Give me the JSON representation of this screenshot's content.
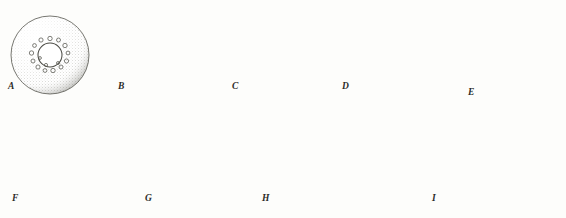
{
  "figure": {
    "kind": "scientific-illustration",
    "technique": "stipple engraving",
    "page_number": "",
    "background_color": "#fdfdfb",
    "ink_color": "#3a3a36",
    "rows": 2,
    "panel_count": 9
  },
  "panels": [
    {
      "id": "A",
      "label": "A",
      "row": 1,
      "description": "spherical egg with pale central blastodisc ringed by scattered cells",
      "center": {
        "x": 50,
        "y": 55
      },
      "radius": 39,
      "label_pos": {
        "x": 8,
        "y": 88
      },
      "inner": {
        "type": "open-ring",
        "cx": 50,
        "cy": 55,
        "r": 12,
        "cells": 14,
        "cell_r": 2.1,
        "fill": "#ffffff"
      }
    },
    {
      "id": "B",
      "label": "B",
      "row": 1,
      "description": "egg with dense dark central cell mass surrounded by a broad ring of cells",
      "center": {
        "x": 160,
        "y": 55
      },
      "radius": 39,
      "label_pos": {
        "x": 118,
        "y": 88
      },
      "inner": {
        "type": "dark-mass",
        "cx": 160,
        "cy": 55,
        "r": 13,
        "cells": 22,
        "cell_r": 2.1,
        "fill": "#4a4a45"
      }
    },
    {
      "id": "C",
      "label": "C",
      "row": 1,
      "description": "egg with pale blastodisc outlined by a germ ring, small notch at right",
      "center": {
        "x": 272,
        "y": 55
      },
      "radius": 38,
      "label_pos": {
        "x": 232,
        "y": 88
      },
      "inner": {
        "type": "outlined-disc",
        "cx": 270,
        "cy": 56,
        "r": 13,
        "cells": 20,
        "cell_r": 1.9,
        "fill": "#fbfbf8"
      }
    },
    {
      "id": "D",
      "label": "D",
      "row": 1,
      "description": "egg with enlarged blastodisc and thickened germ ring, notch at right",
      "center": {
        "x": 382,
        "y": 55
      },
      "radius": 38,
      "label_pos": {
        "x": 342,
        "y": 88
      },
      "inner": {
        "type": "outlined-disc",
        "cx": 381,
        "cy": 56,
        "r": 15,
        "cells": 26,
        "cell_r": 1.9,
        "fill": "#f7f7f3"
      }
    },
    {
      "id": "E",
      "label": "E",
      "row": 1,
      "description": "egg rotated showing crescent blastoderm cap with a curved groove across the surface",
      "center": {
        "x": 500,
        "y": 55
      },
      "radius": 39,
      "label_pos": {
        "x": 468,
        "y": 92
      },
      "inner": {
        "type": "crescent-groove",
        "cx": 500,
        "cy": 55
      }
    },
    {
      "id": "F",
      "label": "F",
      "row": 2,
      "description": "egg with embryonic shield and elongating keel, dark shaded crescent at right",
      "center": {
        "x": 62,
        "y": 163
      },
      "radius": 39,
      "label_pos": {
        "x": 12,
        "y": 200
      },
      "inner": {
        "type": "embryonic-shield",
        "cx": 62,
        "cy": 163
      }
    },
    {
      "id": "G",
      "label": "G",
      "row": 2,
      "description": "egg with elongated embryo body band stretching across the yolk",
      "center": {
        "x": 187,
        "y": 164
      },
      "radius": 38,
      "label_pos": {
        "x": 145,
        "y": 200
      },
      "inner": {
        "type": "embryo-band",
        "cx": 187,
        "cy": 164
      }
    },
    {
      "id": "H",
      "label": "H",
      "row": 2,
      "description": "egg containing curled embryo with pigmented eyes and branching yolk-sac vasculature",
      "center": {
        "x": 305,
        "y": 163
      },
      "radius": 37,
      "label_pos": {
        "x": 262,
        "y": 200
      },
      "inner": {
        "type": "curled-embryo",
        "cx": 305,
        "cy": 163
      }
    },
    {
      "id": "I",
      "label": "I",
      "row": 2,
      "description": "newly hatched larva with large pigmented eye, pendulous yolk sac, dorsal fin fold and rounded caudal fin",
      "center": {
        "x": 455,
        "y": 160
      },
      "label_pos": {
        "x": 432,
        "y": 200
      },
      "inner": {
        "type": "hatched-larva"
      }
    }
  ]
}
